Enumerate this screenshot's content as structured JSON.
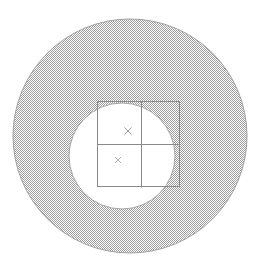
{
  "figure": {
    "title": "",
    "background_color": "#ffffff",
    "width": 261,
    "height": 272
  },
  "chart_data": {
    "type": "diagram",
    "title": "",
    "subtitle": "",
    "xlabel": "",
    "ylabel": "",
    "grid": false,
    "legend": "none",
    "units": "pixels",
    "xlim": [
      0,
      261
    ],
    "ylim": [
      0,
      272
    ],
    "shapes": [
      {
        "name": "outer-circle",
        "type": "circle",
        "cx": 130,
        "cy": 136,
        "r": 117,
        "fill": "hatch-grey",
        "fill_color": "#a8a8a8",
        "stroke": "#909090",
        "stroke_width": 1
      },
      {
        "name": "inner-circle",
        "type": "circle",
        "cx": 122,
        "cy": 156,
        "r": 53,
        "fill": "#ffffff",
        "stroke": "#909090",
        "stroke_width": 1
      },
      {
        "name": "bounding-rectangle",
        "type": "rect",
        "x": 97,
        "y": 101,
        "width": 83,
        "height": 86,
        "fill": "none",
        "stroke": "#8a8a8a",
        "stroke_width": 1
      },
      {
        "name": "rect-vertical-divider",
        "type": "line",
        "x1": 141,
        "y1": 101,
        "x2": 141,
        "y2": 187,
        "stroke": "#8a8a8a",
        "stroke_width": 1
      },
      {
        "name": "rect-horizontal-divider",
        "type": "line",
        "x1": 97,
        "y1": 144,
        "x2": 180,
        "y2": 144,
        "stroke": "#8a8a8a",
        "stroke_width": 1
      }
    ],
    "markers": [
      {
        "name": "marker-upper",
        "symbol": "x",
        "x": 128,
        "y": 131,
        "size": 7,
        "color": "#9a9a9a"
      },
      {
        "name": "marker-lower",
        "symbol": "x",
        "x": 118,
        "y": 160,
        "size": 6,
        "color": "#b0b0b0"
      }
    ],
    "colors": {
      "hatch_fill": "#a8a8a8",
      "hatch_background": "#ffffff",
      "outline": "#8a8a8a",
      "circle_outline": "#909090",
      "marker": "#9a9a9a",
      "page_background": "#ffffff"
    },
    "annotations": []
  }
}
